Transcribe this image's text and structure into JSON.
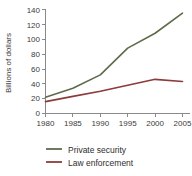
{
  "chart_data": {
    "type": "line",
    "title": "",
    "xlabel": "",
    "ylabel": "Billions of dollars",
    "x": [
      1980,
      1985,
      1990,
      1995,
      2000,
      2005
    ],
    "xticklabels": [
      "1980",
      "1985",
      "1990",
      "1995",
      "2000",
      "2005"
    ],
    "yticklabels": [
      "0",
      "20",
      "40",
      "60",
      "80",
      "100",
      "120",
      "140"
    ],
    "yticks": [
      0,
      20,
      40,
      60,
      80,
      100,
      120,
      140
    ],
    "ylim": [
      0,
      145
    ],
    "xlim": [
      1980,
      2006
    ],
    "grid": false,
    "legend_position": "bottom-left",
    "series": [
      {
        "name": "Private security",
        "color": "#5d6b4b",
        "values": [
          22,
          34,
          52,
          88,
          108,
          135
        ]
      },
      {
        "name": "Law enforcement",
        "color": "#8c3b3b",
        "values": [
          16,
          23,
          30,
          38,
          46,
          43
        ]
      }
    ]
  },
  "axis": {
    "y_title": "Billions of dollars"
  },
  "legend": {
    "items": [
      {
        "label": "Private security",
        "color": "#5d6b4b"
      },
      {
        "label": "Law enforcement",
        "color": "#8c3b3b"
      }
    ]
  }
}
